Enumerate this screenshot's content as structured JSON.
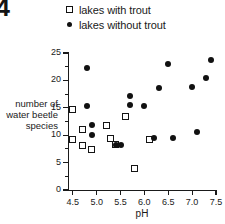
{
  "figure": {
    "label": "4"
  },
  "legend": {
    "position": "top",
    "entries": [
      {
        "marker": "open-square",
        "label": "lakes with trout"
      },
      {
        "marker": "filled-circle",
        "label": "lakes without trout"
      }
    ]
  },
  "axes": {
    "x_title": "pH",
    "y_title_lines": [
      "number of",
      "water beetle",
      "species"
    ],
    "x_ticks": [
      "4.5",
      "5.0",
      "5.5",
      "6.0",
      "6.5",
      "7.0",
      "7.5"
    ],
    "y_ticks": [
      "0",
      "5",
      "10",
      "15",
      "20",
      "25"
    ]
  },
  "colors": {
    "axis": "#1a1a1a",
    "marker_fill": "#111111",
    "marker_open_fill": "#ffffff",
    "background": "#ffffff"
  },
  "chart_data": {
    "type": "scatter",
    "title": "",
    "xlabel": "pH",
    "ylabel": "number of water beetle species",
    "xlim": [
      4.4,
      7.5
    ],
    "ylim": [
      0,
      25
    ],
    "xticks": [
      4.5,
      5.0,
      5.5,
      6.0,
      6.5,
      7.0,
      7.5
    ],
    "yticks": [
      0,
      5,
      10,
      15,
      20,
      25
    ],
    "grid": false,
    "legend_position": "above-plot",
    "series": [
      {
        "name": "lakes with trout",
        "marker": "open-square",
        "points": [
          {
            "x": 4.5,
            "y": 14.6
          },
          {
            "x": 4.5,
            "y": 9.2
          },
          {
            "x": 4.7,
            "y": 11.1
          },
          {
            "x": 4.7,
            "y": 8.1
          },
          {
            "x": 4.9,
            "y": 7.4
          },
          {
            "x": 5.2,
            "y": 11.8
          },
          {
            "x": 5.3,
            "y": 9.4
          },
          {
            "x": 5.4,
            "y": 8.3
          },
          {
            "x": 5.6,
            "y": 13.5
          },
          {
            "x": 5.8,
            "y": 4.0
          },
          {
            "x": 6.1,
            "y": 9.3
          }
        ]
      },
      {
        "name": "lakes without trout",
        "marker": "filled-circle",
        "points": [
          {
            "x": 4.8,
            "y": 22.3
          },
          {
            "x": 4.8,
            "y": 15.3
          },
          {
            "x": 4.9,
            "y": 11.9
          },
          {
            "x": 4.9,
            "y": 10.1
          },
          {
            "x": 5.4,
            "y": 8.2
          },
          {
            "x": 5.5,
            "y": 8.2
          },
          {
            "x": 5.7,
            "y": 17.2
          },
          {
            "x": 5.7,
            "y": 15.5
          },
          {
            "x": 6.0,
            "y": 15.4
          },
          {
            "x": 6.2,
            "y": 9.4
          },
          {
            "x": 6.3,
            "y": 18.7
          },
          {
            "x": 6.5,
            "y": 23.0
          },
          {
            "x": 6.6,
            "y": 9.5
          },
          {
            "x": 7.0,
            "y": 18.8
          },
          {
            "x": 7.1,
            "y": 10.6
          },
          {
            "x": 7.3,
            "y": 20.5
          },
          {
            "x": 7.4,
            "y": 23.7
          }
        ]
      }
    ]
  }
}
